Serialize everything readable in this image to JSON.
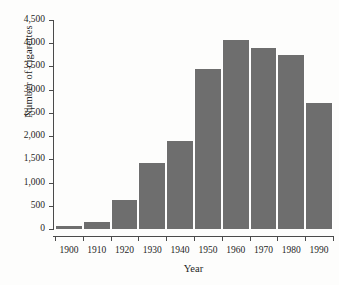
{
  "chart_data": {
    "type": "bar",
    "title": "",
    "xlabel": "Year",
    "ylabel": "Number of cigarettes",
    "categories": [
      "1900",
      "1910",
      "1920",
      "1930",
      "1940",
      "1950",
      "1960",
      "1970",
      "1980",
      "1990"
    ],
    "values": [
      54,
      140,
      630,
      1420,
      1900,
      3450,
      4080,
      3900,
      3750,
      2710
    ],
    "ylim": [
      0,
      4500
    ],
    "ytick_labels": [
      "0",
      "500",
      "1,000",
      "1,500",
      "2,000",
      "2,500",
      "3,000",
      "3,500",
      "4,000",
      "4,500"
    ],
    "ytick_values": [
      0,
      500,
      1000,
      1500,
      2000,
      2500,
      3000,
      3500,
      4000,
      4500
    ],
    "grid": false,
    "legend": null,
    "bar_color": "#6e6e6e",
    "axis_color": "#4a4a4a",
    "background": "#fdfdfc"
  }
}
